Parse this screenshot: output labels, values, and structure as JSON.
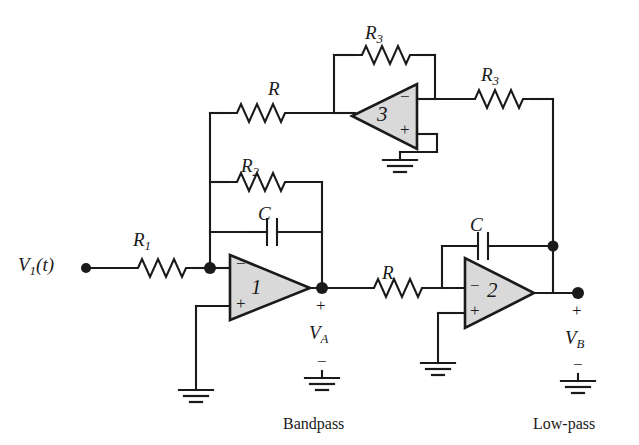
{
  "figure": {
    "kind": "schematic",
    "background_color": "#ffffff",
    "wire_color": "#1a1a1a",
    "opamp_fill": "#d9d9d9"
  },
  "source": {
    "label_v": "V",
    "label_sub": "1",
    "label_t": "(t)",
    "terminal": "input-terminal-dot"
  },
  "components": {
    "r1": {
      "label": "R",
      "subscript": "1"
    },
    "r2": {
      "label": "R",
      "subscript": "2"
    },
    "r_top": {
      "label": "R",
      "subscript": ""
    },
    "r_mid": {
      "label": "R",
      "subscript": ""
    },
    "r3_feedback": {
      "label": "R",
      "subscript": "3"
    },
    "r3_output": {
      "label": "R",
      "subscript": "3"
    },
    "c1": {
      "label": "C",
      "subscript": ""
    },
    "c2": {
      "label": "C",
      "subscript": ""
    }
  },
  "opamps": [
    {
      "id": "opamp1",
      "number": "1",
      "minus": "−",
      "plus": "+",
      "orientation": "right"
    },
    {
      "id": "opamp2",
      "number": "2",
      "minus": "−",
      "plus": "+",
      "orientation": "right"
    },
    {
      "id": "opamp3",
      "number": "3",
      "minus": "−",
      "plus": "+",
      "orientation": "left"
    }
  ],
  "nodes": {
    "va": {
      "name": "V",
      "subscript": "A",
      "plus": "+",
      "minus": "−",
      "caption": "Bandpass"
    },
    "vb": {
      "name": "V",
      "subscript": "B",
      "plus": "+",
      "minus": "−",
      "caption": "Low-pass"
    }
  },
  "grounds": [
    {
      "id": "gnd-opamp1",
      "name": "ground-symbol"
    },
    {
      "id": "gnd-opamp2",
      "name": "ground-symbol"
    },
    {
      "id": "gnd-opamp3",
      "name": "ground-symbol"
    },
    {
      "id": "gnd-va",
      "name": "ground-symbol"
    },
    {
      "id": "gnd-vb",
      "name": "ground-symbol"
    }
  ]
}
